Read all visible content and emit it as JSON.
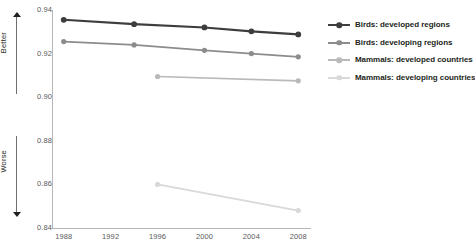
{
  "chart_data": {
    "type": "line",
    "title": "",
    "subtitle": "",
    "xlabel": "",
    "ylabel": "",
    "x": [
      1988,
      1992,
      1996,
      2000,
      2004,
      2008
    ],
    "xlim": [
      1987,
      2009
    ],
    "ylim": [
      0.84,
      0.94
    ],
    "yticks": [
      "0.94",
      "0.92",
      "0.90",
      "0.88",
      "0.86",
      "0.84"
    ],
    "ytick_values": [
      0.94,
      0.92,
      0.9,
      0.88,
      0.86,
      0.84
    ],
    "xticks": [
      "1988",
      "1992",
      "1996",
      "2000",
      "2004",
      "2008"
    ],
    "grid": false,
    "legend_position": "right",
    "annotations": [
      {
        "name": "better",
        "text": "Better",
        "direction": "up"
      },
      {
        "name": "worse",
        "text": "Worse",
        "direction": "down"
      }
    ],
    "series": [
      {
        "name": "Birds: developed regions",
        "color": "#3d3d3d",
        "x": [
          1988,
          1994,
          2000,
          2004,
          2008
        ],
        "values": [
          0.9355,
          0.9335,
          0.932,
          0.9302,
          0.9288
        ]
      },
      {
        "name": "Birds: developing regions",
        "color": "#8c8c8c",
        "x": [
          1988,
          1994,
          2000,
          2004,
          2008
        ],
        "values": [
          0.9255,
          0.924,
          0.9215,
          0.92,
          0.9185
        ]
      },
      {
        "name": "Mammals: developed countries",
        "color": "#b9b9b9",
        "x": [
          1996,
          2008
        ],
        "values": [
          0.9095,
          0.9075
        ]
      },
      {
        "name": "Mammals: developing countries",
        "color": "#d9d9d9",
        "x": [
          1996,
          2008
        ],
        "values": [
          0.86,
          0.848
        ]
      }
    ]
  },
  "legend": {
    "items": [
      {
        "label": "Birds: developed regions",
        "color": "#3d3d3d"
      },
      {
        "label": "Birds: developing regions",
        "color": "#8c8c8c"
      },
      {
        "label": "Mammals: developed countries",
        "color": "#b9b9b9"
      },
      {
        "label": "Mammals: developing countries",
        "color": "#d9d9d9"
      }
    ]
  }
}
